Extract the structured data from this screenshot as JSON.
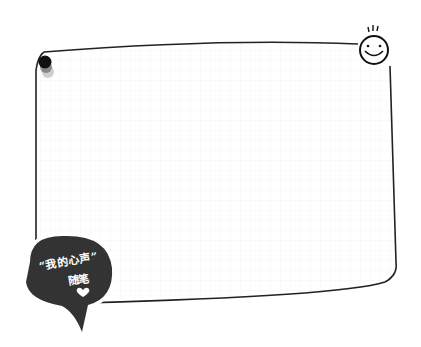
{
  "note_frame": {
    "type": "blank memo card with faint grid",
    "border_color": "#222222",
    "grid_color": "#eeeeee"
  },
  "badge": {
    "line1": "“我的心声”",
    "line2": "随笔",
    "fill_color": "#333333",
    "icon": "heart-icon"
  },
  "decorations": {
    "pin": "pushpin-icon",
    "smiley": "smiley-face-icon"
  }
}
